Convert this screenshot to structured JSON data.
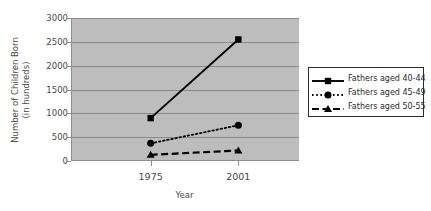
{
  "chart_data": {
    "type": "line",
    "title": "",
    "xlabel": "Year",
    "ylabel": "Number of Children Born (in hundreds)",
    "ylabel_lines": [
      "Number of Children Born",
      "(in hundreds)"
    ],
    "categories": [
      "1975",
      "2001"
    ],
    "ylim": [
      0,
      3000
    ],
    "yticks": [
      0,
      500,
      1000,
      1500,
      2000,
      2500,
      3000
    ],
    "ytick_labels": [
      "0",
      "500",
      "1000",
      "1500",
      "2000",
      "2500",
      "3000"
    ],
    "grid": true,
    "legend_position": "right",
    "plot_background": "#bdbdbd",
    "series": [
      {
        "name": "Fathers aged 40-44",
        "values": [
          900,
          2550
        ],
        "style": "solid",
        "marker": "square",
        "color": "#000000"
      },
      {
        "name": "Fathers aged 45-49",
        "values": [
          370,
          750
        ],
        "style": "dotted",
        "marker": "circle",
        "color": "#000000"
      },
      {
        "name": "Fathers aged 50-55",
        "values": [
          130,
          220
        ],
        "style": "dashed",
        "marker": "triangle",
        "color": "#000000"
      }
    ]
  },
  "legend": {
    "entries": [
      "Fathers aged 40-44",
      "Fathers aged 45-49",
      "Fathers aged 50-55"
    ]
  }
}
